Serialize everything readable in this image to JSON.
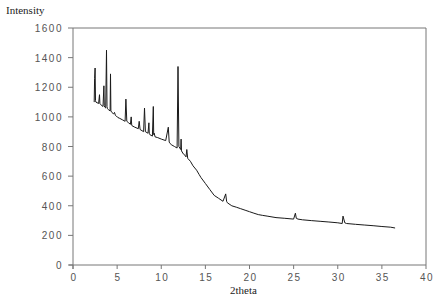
{
  "chart_data": {
    "type": "line",
    "title": "",
    "xlabel": "2theta",
    "ylabel": "Intensity",
    "xlim": [
      0,
      40
    ],
    "ylim": [
      0,
      1600
    ],
    "xticks": [
      0,
      5,
      10,
      15,
      20,
      25,
      30,
      35,
      40
    ],
    "yticks": [
      0,
      200,
      400,
      600,
      800,
      1000,
      1200,
      1400,
      1600
    ],
    "xtick_labels": [
      "0",
      "5",
      "10",
      "15",
      "20",
      "25",
      "30",
      "35",
      "40"
    ],
    "ytick_labels": [
      "0",
      "200",
      "400",
      "600",
      "800",
      "1000",
      "1200",
      "1400",
      "1600"
    ],
    "grid": false,
    "legend": null,
    "line_color": "#1a1a1a",
    "series": [
      {
        "name": "XRD pattern",
        "x": [
          2.4,
          2.45,
          2.5,
          2.55,
          2.6,
          2.9,
          3.0,
          3.05,
          3.1,
          3.4,
          3.5,
          3.55,
          3.6,
          3.7,
          3.8,
          3.85,
          3.9,
          4.0,
          4.2,
          4.25,
          4.3,
          4.4,
          4.6,
          4.7,
          4.8,
          4.9,
          5.0,
          5.05,
          5.1,
          5.3,
          5.6,
          5.9,
          6.0,
          6.1,
          6.3,
          6.5,
          6.6,
          6.65,
          6.7,
          7.0,
          7.4,
          7.5,
          7.6,
          8.0,
          8.1,
          8.2,
          8.5,
          8.6,
          8.65,
          8.7,
          9.0,
          9.1,
          9.15,
          9.2,
          9.3,
          9.6,
          10.0,
          10.5,
          10.8,
          10.9,
          11.0,
          11.2,
          11.5,
          11.8,
          11.9,
          12.0,
          12.1,
          12.2,
          12.25,
          12.3,
          12.5,
          12.7,
          12.8,
          12.9,
          13.0,
          13.3,
          13.6,
          14.0,
          14.3,
          14.5,
          15.0,
          15.5,
          16.0,
          16.5,
          17.0,
          17.3,
          17.4,
          17.5,
          18.0,
          18.5,
          19.0,
          19.5,
          20.0,
          20.5,
          21.0,
          21.5,
          22.0,
          23.0,
          24.0,
          25.0,
          25.2,
          25.3,
          25.5,
          26.0,
          27.0,
          28.0,
          29.0,
          30.0,
          30.5,
          30.6,
          30.8,
          31.0,
          32.0,
          33.0,
          34.0,
          35.0,
          36.0,
          36.5
        ],
        "y": [
          1100,
          1260,
          1330,
          1110,
          1100,
          1090,
          1150,
          1090,
          1085,
          1070,
          1210,
          1075,
          1065,
          1060,
          1450,
          1070,
          1055,
          1050,
          1040,
          1290,
          1040,
          1030,
          1020,
          1030,
          1010,
          1005,
          1000,
          1000,
          995,
          990,
          980,
          970,
          1120,
          970,
          960,
          950,
          1000,
          945,
          940,
          930,
          920,
          970,
          915,
          900,
          1060,
          900,
          890,
          960,
          885,
          880,
          870,
          1070,
          880,
          890,
          865,
          860,
          850,
          840,
          930,
          830,
          820,
          810,
          800,
          790,
          1340,
          800,
          790,
          780,
          850,
          770,
          750,
          740,
          730,
          780,
          720,
          700,
          670,
          640,
          610,
          590,
          550,
          510,
          470,
          450,
          430,
          480,
          430,
          420,
          400,
          390,
          380,
          370,
          360,
          350,
          340,
          335,
          330,
          320,
          315,
          310,
          350,
          315,
          310,
          305,
          300,
          295,
          290,
          285,
          280,
          330,
          285,
          280,
          275,
          270,
          265,
          260,
          255,
          250
        ]
      }
    ]
  },
  "labels": {
    "y_axis_title": "Intensity",
    "x_axis_title": "2theta",
    "footer": "· · · · · · · · · · ·    · · ·   · · · ·  · · · · · · · ·"
  }
}
